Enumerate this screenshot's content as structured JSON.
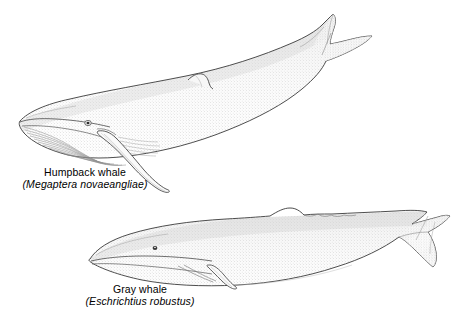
{
  "figure": {
    "kind": "scientific-illustration",
    "style": "stipple-shaded line drawing",
    "background_color": "#ffffff",
    "ink_color": "#333333",
    "fill_color": "#fbfbfb",
    "stipple_color": "#8d8d8d"
  },
  "specimens": [
    {
      "id": "humpback",
      "common_name": "Humpback whale",
      "scientific_name": "Megaptera novaeangliae",
      "scientific_name_display": "(Megaptera novaeangliae)",
      "pose": "swimming upward to the right, flukes raised",
      "features": [
        "long pectoral flipper",
        "ventral throat pleats",
        "small hooked dorsal fin",
        "knobbed rostrum",
        "notched flukes"
      ]
    },
    {
      "id": "gray",
      "common_name": "Gray whale",
      "scientific_name": "Eschrichtius robustus",
      "scientific_name_display": "(Eschrichtius robustus)",
      "pose": "swimming level to the right",
      "features": [
        "short paddle-shaped pectoral flipper",
        "dorsal hump with knuckles",
        "short throat grooves",
        "arched rostrum",
        "broad flukes"
      ]
    }
  ],
  "labels": {
    "humpback_common": "Humpback whale",
    "humpback_scientific": "(Megaptera novaeangliae)",
    "gray_common": "Gray whale",
    "gray_scientific": "(Eschrichtius robustus)"
  }
}
